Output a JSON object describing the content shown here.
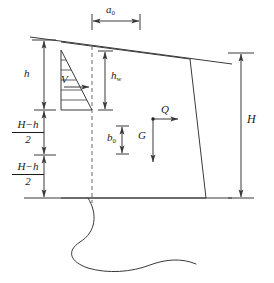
{
  "figure": {
    "type": "engineering-diagram",
    "background_color": "#ffffff",
    "line_color": "#3a3a3a",
    "text_color": "#1a1a1a",
    "width": 274,
    "height": 283
  },
  "labels": {
    "crest_width": "a",
    "crest_width_sub": "0",
    "upper_height": "h",
    "water_head": "h",
    "water_head_sub": "w",
    "resultant_water_force": "V",
    "self_weight": "G",
    "horizontal_load": "Q",
    "weight_arm": "b",
    "weight_arm_sub": "0",
    "total_height": "H"
  },
  "fractions": {
    "mid_segment": {
      "numerator": "H−h",
      "denominator": "2"
    },
    "lower_segment": {
      "numerator": "H−h",
      "denominator": "2"
    }
  },
  "geometry": {
    "dam_outline": "M 61,42 L 190,59 L 206,198 L 61,198 Z",
    "ground_line_y": 198,
    "crest_top_left_x": 61,
    "crest_top_right_x": 190,
    "upstream_face_x": 61,
    "toe_x": 206,
    "slope_line": "M 30,37 L 232,64",
    "centerline_x": 92,
    "pressure_triangle": "M 61,50 L 61,110 L 92,110 Z",
    "hatch_count": 6
  },
  "dimensions": {
    "a0": {
      "x1": 92,
      "x2": 140,
      "y": 21,
      "label_x": 110,
      "label_y": 9
    },
    "h": {
      "x": 44,
      "y1": 40,
      "y2": 110,
      "label_x": 28,
      "label_y": 70
    },
    "mid": {
      "x": 44,
      "y1": 110,
      "y2": 155,
      "label_x": 18,
      "label_y": 124
    },
    "lower": {
      "x": 44,
      "y1": 155,
      "y2": 198,
      "label_x": 18,
      "label_y": 166
    },
    "hw": {
      "x": 105,
      "y1": 51,
      "y2": 110,
      "label_x": 112,
      "label_y": 74
    },
    "b0": {
      "x": 122,
      "y1": 126,
      "y2": 154,
      "label_x": 110,
      "label_y": 136
    },
    "H": {
      "x": 241,
      "y1": 53,
      "y2": 198,
      "label_x": 248,
      "label_y": 118
    }
  },
  "force_vectors": {
    "V": {
      "x1": 64,
      "y1": 87,
      "x2": 89,
      "y2": 87,
      "label_x": 49,
      "label_y": 80
    },
    "Q": {
      "x1": 153,
      "y1": 119,
      "x2": 178,
      "y2": 119,
      "label_x": 160,
      "label_y": 108
    },
    "G": {
      "x1": 153,
      "y1": 119,
      "x2": 153,
      "y2": 162,
      "label_x": 139,
      "label_y": 134
    }
  }
}
